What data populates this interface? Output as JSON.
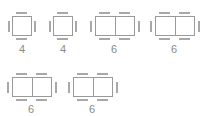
{
  "colors": {
    "outline": "#9a9a9a",
    "chair": "#a8a8a8",
    "label": "#8a8a8a",
    "background": "#ffffff"
  },
  "tables": [
    {
      "id": "table-1",
      "seats": "4",
      "type": "square"
    },
    {
      "id": "table-2",
      "seats": "4",
      "type": "square"
    },
    {
      "id": "table-3",
      "seats": "6",
      "type": "rectangle"
    },
    {
      "id": "table-4",
      "seats": "6",
      "type": "rectangle"
    },
    {
      "id": "table-5",
      "seats": "6",
      "type": "rectangle"
    },
    {
      "id": "table-6",
      "seats": "6",
      "type": "rectangle"
    }
  ]
}
